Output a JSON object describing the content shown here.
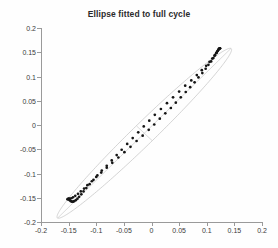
{
  "figure": {
    "title": "Ellipse fitted to full cycle",
    "background_color": "#fefefe",
    "axis_color": "#9a9a9a",
    "point_color": "#151515",
    "ellipse_color": "#c2c2c2"
  },
  "chart_data": {
    "type": "scatter",
    "title": "Ellipse fitted to full cycle",
    "xlabel": "",
    "ylabel": "",
    "xlim": [
      -0.2,
      0.2
    ],
    "ylim": [
      -0.2,
      0.2
    ],
    "xticks": [
      -0.2,
      -0.15,
      -0.1,
      -0.05,
      0,
      0.05,
      0.1,
      0.15,
      0.2
    ],
    "yticks": [
      -0.2,
      -0.15,
      -0.1,
      -0.05,
      0,
      0.05,
      0.1,
      0.15,
      0.2
    ],
    "xticklabels": [
      "-0.2",
      "-0.15",
      "-0.1",
      "-0.05",
      "0",
      "0.05",
      "0.1",
      "0.15",
      "0.2"
    ],
    "yticklabels": [
      "-0.2",
      "-0.15",
      "-0.1",
      "-0.05",
      "0",
      "0.05",
      "0.1",
      "0.15",
      "0.2"
    ],
    "grid": false,
    "legend": null,
    "series": [
      {
        "name": "measured cycle (upper branch)",
        "marker": "dot",
        "color": "#151515",
        "x": [
          -0.15,
          -0.148,
          -0.146,
          -0.144,
          -0.142,
          -0.14,
          -0.137,
          -0.134,
          -0.131,
          -0.127,
          -0.123,
          -0.118,
          -0.112,
          -0.105,
          -0.098,
          -0.09,
          -0.081,
          -0.072,
          -0.063,
          -0.054,
          -0.044,
          -0.034,
          -0.024,
          -0.014,
          -0.004,
          0.006,
          0.017,
          0.028,
          0.039,
          0.05,
          0.061,
          0.072,
          0.082,
          0.091,
          0.099,
          0.105,
          0.11,
          0.114,
          0.117,
          0.119,
          0.121,
          0.122,
          0.123,
          0.124
        ],
        "y": [
          -0.152,
          -0.155,
          -0.157,
          -0.158,
          -0.158,
          -0.157,
          -0.155,
          -0.152,
          -0.148,
          -0.143,
          -0.137,
          -0.13,
          -0.122,
          -0.113,
          -0.104,
          -0.094,
          -0.084,
          -0.073,
          -0.062,
          -0.051,
          -0.039,
          -0.027,
          -0.015,
          -0.003,
          0.009,
          0.021,
          0.033,
          0.045,
          0.057,
          0.069,
          0.081,
          0.092,
          0.103,
          0.113,
          0.122,
          0.13,
          0.137,
          0.143,
          0.148,
          0.152,
          0.155,
          0.157,
          0.158,
          0.158
        ]
      },
      {
        "name": "measured cycle (lower branch)",
        "marker": "dot",
        "color": "#151515",
        "x": [
          0.124,
          0.122,
          0.12,
          0.118,
          0.115,
          0.112,
          0.108,
          0.103,
          0.098,
          0.092,
          0.085,
          0.078,
          0.07,
          0.062,
          0.053,
          0.044,
          0.035,
          0.025,
          0.015,
          0.005,
          -0.005,
          -0.016,
          -0.027,
          -0.038,
          -0.049,
          -0.06,
          -0.071,
          -0.081,
          -0.091,
          -0.1,
          -0.108,
          -0.116,
          -0.122,
          -0.128,
          -0.133,
          -0.138,
          -0.142,
          -0.145,
          -0.148,
          -0.15,
          -0.151,
          -0.152
        ],
        "y": [
          0.158,
          0.156,
          0.153,
          0.149,
          0.144,
          0.138,
          0.131,
          0.124,
          0.116,
          0.107,
          0.098,
          0.088,
          0.078,
          0.068,
          0.057,
          0.046,
          0.035,
          0.024,
          0.013,
          0.001,
          -0.01,
          -0.022,
          -0.033,
          -0.045,
          -0.056,
          -0.067,
          -0.078,
          -0.088,
          -0.098,
          -0.107,
          -0.116,
          -0.124,
          -0.131,
          -0.137,
          -0.142,
          -0.146,
          -0.149,
          -0.151,
          -0.152,
          -0.153,
          -0.153,
          -0.153
        ]
      },
      {
        "name": "fitted ellipse",
        "marker": "line",
        "color": "#c2c2c2",
        "center": [
          -0.013,
          -0.017
        ],
        "semi_major": 0.235,
        "semi_minor": 0.021,
        "rotation_deg": 48.0
      }
    ],
    "annotations": [
      {
        "name": "major-axis-line",
        "type": "line",
        "from": [
          -0.17,
          -0.192
        ],
        "to": [
          0.144,
          0.158
        ]
      },
      {
        "name": "minor-axis-line",
        "type": "line",
        "from": [
          -0.027,
          -0.002
        ],
        "to": [
          0.001,
          -0.032
        ]
      }
    ]
  },
  "axes": {
    "y_ticks": [
      {
        "value": 0.2,
        "label": "0.2"
      },
      {
        "value": 0.15,
        "label": "0.15"
      },
      {
        "value": 0.1,
        "label": "0.1"
      },
      {
        "value": 0.05,
        "label": "0.05"
      },
      {
        "value": 0,
        "label": "0"
      },
      {
        "value": -0.05,
        "label": "-0.05"
      },
      {
        "value": -0.1,
        "label": "-0.1"
      },
      {
        "value": -0.15,
        "label": "-0.15"
      },
      {
        "value": -0.2,
        "label": "-0.2"
      }
    ],
    "x_ticks": [
      {
        "value": -0.2,
        "label": "-0.2"
      },
      {
        "value": -0.15,
        "label": "-0.15"
      },
      {
        "value": -0.1,
        "label": "-0.1"
      },
      {
        "value": -0.05,
        "label": "-0.05"
      },
      {
        "value": 0,
        "label": "0"
      },
      {
        "value": 0.05,
        "label": "0.05"
      },
      {
        "value": 0.1,
        "label": "0.1"
      },
      {
        "value": 0.15,
        "label": "0.15"
      },
      {
        "value": 0.2,
        "label": "0.2"
      }
    ]
  }
}
